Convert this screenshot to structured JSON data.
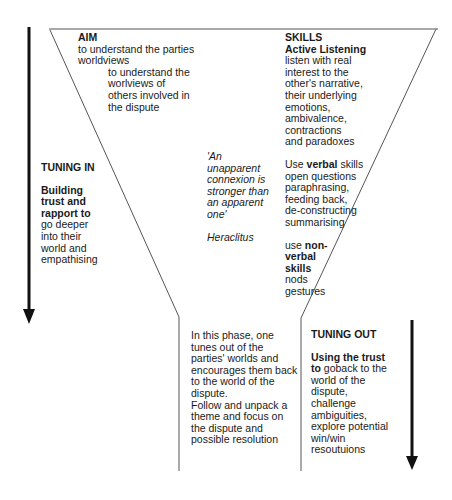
{
  "aim": {
    "heading": "AIM",
    "line1": "to understand the parties",
    "line2": "worldviews",
    "sub": [
      "to understand the",
      "worlviews of",
      "others involved in",
      "the dispute"
    ]
  },
  "skills": {
    "heading": "SKILLS",
    "subheading": "Active Listening",
    "listening_lines": [
      "listen with real",
      "interest to the",
      "other's narrative,",
      "their underlying",
      "emotions,",
      "ambivalence,",
      "contractions",
      "and paradoxes"
    ],
    "verbal_prefix": "Use ",
    "verbal_bold": "verbal",
    "verbal_suffix": " skills",
    "verbal_lines": [
      "open questions",
      "paraphrasing,",
      "feeding back,",
      "de-constructing",
      "summarising"
    ],
    "nonverbal_prefix": "use ",
    "nonverbal_bold_lines": [
      "non-",
      "verbal",
      "skills"
    ],
    "nonverbal_lines": [
      "nods",
      "gestures"
    ]
  },
  "quote": {
    "lines": [
      "'An",
      "unapparent",
      "connexion is",
      "stronger than",
      "an apparent",
      "one'"
    ],
    "author": "Heraclitus"
  },
  "tuning_in": {
    "heading": "TUNING IN",
    "bold_lines": [
      "Building",
      "trust and",
      "rapport to"
    ],
    "lines": [
      "go deeper",
      "into their",
      "world and",
      "empathising"
    ]
  },
  "phase": {
    "lines": [
      "In this phase, one",
      "tunes out of the",
      "parties' worlds and",
      "encourages them back",
      "to the world of the",
      "dispute.",
      "Follow and unpack a",
      "theme and focus on",
      "the dispute and",
      "possible resolution"
    ]
  },
  "tuning_out": {
    "heading": "TUNING OUT",
    "bold_line1": "Using the trust",
    "bold_line2": "to",
    "line2_rest": " goback to the",
    "lines": [
      "world of the",
      "dispute,",
      "challenge",
      "ambiguities,",
      "explore potential",
      "win/win",
      "resoutuions"
    ]
  },
  "colors": {
    "line": "#555555",
    "arrow": "#111111",
    "text": "#1a1a1a"
  }
}
